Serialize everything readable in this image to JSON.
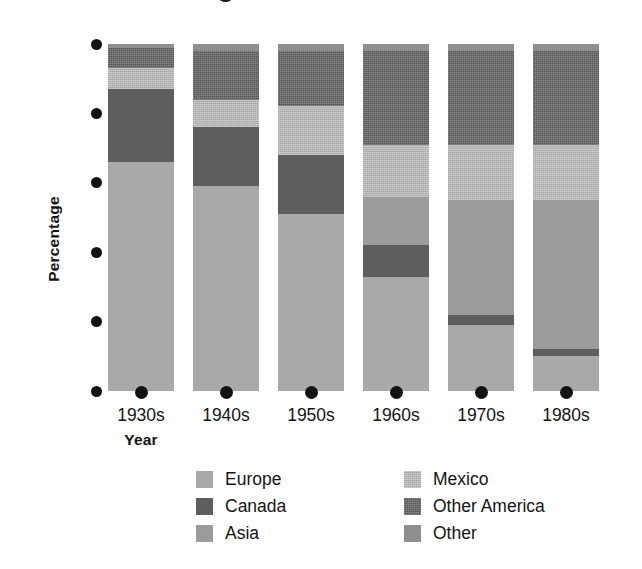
{
  "chart_data": {
    "type": "bar",
    "subtype": "stacked-bar-100-percent",
    "title": "",
    "xlabel": "Year",
    "ylabel": "Percentage",
    "categories": [
      "1930s",
      "1940s",
      "1950s",
      "1960s",
      "1970s",
      "1980s"
    ],
    "ylim": [
      0,
      100
    ],
    "yticks": [
      0,
      20,
      40,
      60,
      80,
      100
    ],
    "ytick_labels": [
      "0",
      "20",
      "40",
      "60",
      "80",
      "100"
    ],
    "grid": false,
    "legend_position": "bottom",
    "stack_order_bottom_to_top": [
      "Europe",
      "Canada",
      "Asia",
      "Mexico",
      "Other America",
      "Other"
    ],
    "series": [
      {
        "name": "Europe",
        "color": "#a9a9a9",
        "values": [
          66,
          59,
          51,
          33,
          19,
          10
        ]
      },
      {
        "name": "Canada",
        "color": "#5e5e5e",
        "values": [
          21,
          17,
          17,
          9,
          3,
          2
        ]
      },
      {
        "name": "Asia",
        "color": "#9b9b9b",
        "values": [
          0,
          0,
          0,
          14,
          33,
          43
        ]
      },
      {
        "name": "Mexico",
        "color": "#b4b4b4",
        "values": [
          6,
          8,
          14,
          15,
          16,
          16
        ]
      },
      {
        "name": "Other America",
        "color": "#585858",
        "values": [
          6,
          14,
          16,
          27,
          27,
          27
        ]
      },
      {
        "name": "Other",
        "color": "#8f8f8f",
        "values": [
          1,
          2,
          2,
          2,
          2,
          2
        ]
      }
    ]
  },
  "axes": {
    "y": {
      "title": "Percentage",
      "ticks": [
        {
          "value": 100,
          "label": "100"
        },
        {
          "value": 80,
          "label": "80"
        },
        {
          "value": 60,
          "label": "60"
        },
        {
          "value": 40,
          "label": "40"
        },
        {
          "value": 20,
          "label": "20"
        },
        {
          "value": 0,
          "label": "0"
        }
      ]
    },
    "x": {
      "title": "Year",
      "ticks": [
        {
          "label": "1930s"
        },
        {
          "label": "1940s"
        },
        {
          "label": "1950s"
        },
        {
          "label": "1960s"
        },
        {
          "label": "1970s"
        },
        {
          "label": "1980s"
        }
      ]
    }
  },
  "legend": {
    "columns": [
      {
        "items": [
          {
            "label": "Europe",
            "color": "#a9a9a9",
            "swatch_class": "f-europe"
          },
          {
            "label": "Canada",
            "color": "#5e5e5e",
            "swatch_class": "f-canada"
          },
          {
            "label": "Asia",
            "color": "#9b9b9b",
            "swatch_class": "f-asia"
          }
        ]
      },
      {
        "items": [
          {
            "label": "Mexico",
            "color": "#b4b4b4",
            "swatch_class": "f-mexico"
          },
          {
            "label": "Other America",
            "color": "#585858",
            "swatch_class": "f-otheramerica"
          },
          {
            "label": "Other",
            "color": "#8f8f8f",
            "swatch_class": "f-other"
          }
        ]
      }
    ]
  }
}
